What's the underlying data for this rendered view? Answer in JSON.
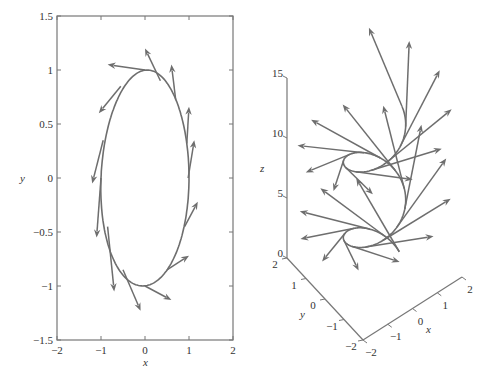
{
  "chart_data": [
    {
      "type": "line",
      "title": "",
      "description": "2D ellipse with tangent vectors",
      "xlabel": "x",
      "ylabel": "y",
      "xlim": [
        -2,
        2
      ],
      "ylim": [
        -1.5,
        1.5
      ],
      "xticks": [
        "-2",
        "-1",
        "0",
        "1",
        "2"
      ],
      "yticks": [
        "-1.5",
        "-1",
        "-0.5",
        "0",
        "0.5",
        "1",
        "1.5"
      ],
      "grid": false,
      "curve": {
        "name": "ellipse",
        "x_radius": 1,
        "y_radius": 1,
        "tilt": 0.18
      },
      "arrows": [
        {
          "x0": 0.0,
          "y0": 1.0,
          "x1": -0.85,
          "y1": 1.05
        },
        {
          "x0": 0.35,
          "y0": 0.9,
          "x1": 0.0,
          "y1": 1.2
        },
        {
          "x0": 0.7,
          "y0": 0.72,
          "x1": 0.6,
          "y1": 1.05
        },
        {
          "x0": 0.95,
          "y0": 0.32,
          "x1": 1.0,
          "y1": 0.66
        },
        {
          "x0": 0.98,
          "y0": 0.0,
          "x1": 1.12,
          "y1": 0.35
        },
        {
          "x0": 0.9,
          "y0": -0.45,
          "x1": 1.2,
          "y1": -0.22
        },
        {
          "x0": 0.5,
          "y0": -0.85,
          "x1": 1.0,
          "y1": -0.72
        },
        {
          "x0": 0.0,
          "y0": -1.0,
          "x1": 0.6,
          "y1": -1.13
        },
        {
          "x0": -0.5,
          "y0": -0.85,
          "x1": -0.1,
          "y1": -1.23
        },
        {
          "x0": -0.85,
          "y0": -0.45,
          "x1": -0.7,
          "y1": -1.05
        },
        {
          "x0": -1.0,
          "y0": 0.0,
          "x1": -1.1,
          "y1": -0.55
        },
        {
          "x0": -0.95,
          "y0": 0.35,
          "x1": -1.2,
          "y1": -0.05
        },
        {
          "x0": -0.55,
          "y0": 0.85,
          "x1": -1.05,
          "y1": 0.6
        }
      ]
    },
    {
      "type": "line3d",
      "title": "",
      "description": "3D helix with tangent vectors",
      "xlabel": "x",
      "ylabel": "y",
      "zlabel": "z",
      "xlim": [
        -2,
        2
      ],
      "ylim": [
        -2,
        2
      ],
      "zlim": [
        0,
        15
      ],
      "xticks": [
        "-2",
        "-1",
        "0",
        "1",
        "2"
      ],
      "yticks": [
        "-2",
        "-1",
        "0",
        "1",
        "2"
      ],
      "zticks": [
        "0",
        "5",
        "10",
        "15"
      ],
      "grid": false,
      "curve": {
        "name": "helix",
        "radius": 1,
        "pitch_per_radian": 1,
        "t_start": 0,
        "t_end": 12.4
      },
      "arrow_count": 24,
      "arrow_length": 3.2
    }
  ],
  "plot2d": {
    "xlabel": "x",
    "ylabel": "y",
    "xticks": [
      {
        "v": -2,
        "label": "−2"
      },
      {
        "v": -1,
        "label": "−1"
      },
      {
        "v": 0,
        "label": "0"
      },
      {
        "v": 1,
        "label": "1"
      },
      {
        "v": 2,
        "label": "2"
      }
    ],
    "yticks": [
      {
        "v": 1.5,
        "label": "1.5"
      },
      {
        "v": 1,
        "label": "1"
      },
      {
        "v": 0.5,
        "label": "0.5"
      },
      {
        "v": 0,
        "label": "0"
      },
      {
        "v": -0.5,
        "label": "−0.5"
      },
      {
        "v": -1,
        "label": "−1"
      },
      {
        "v": -1.5,
        "label": "−1.5"
      }
    ]
  },
  "plot3d": {
    "xlabel": "x",
    "ylabel": "y",
    "zlabel": "z",
    "xticks": [
      {
        "v": -2,
        "label": "−2"
      },
      {
        "v": -1,
        "label": "−1"
      },
      {
        "v": 0,
        "label": "0"
      },
      {
        "v": 1,
        "label": "1"
      },
      {
        "v": 2,
        "label": "2"
      }
    ],
    "yticks": [
      {
        "v": -2,
        "label": "−2"
      },
      {
        "v": -1,
        "label": "−1"
      },
      {
        "v": 0,
        "label": "0"
      },
      {
        "v": 1,
        "label": "1"
      },
      {
        "v": 2,
        "label": "2"
      }
    ],
    "zticks": [
      {
        "v": 0,
        "label": "0"
      },
      {
        "v": 5,
        "label": "5"
      },
      {
        "v": 10,
        "label": "10"
      },
      {
        "v": 15,
        "label": "15"
      }
    ]
  },
  "colors": {
    "curve": "#6e6e6e",
    "axis": "#777777",
    "text": "#333333"
  }
}
